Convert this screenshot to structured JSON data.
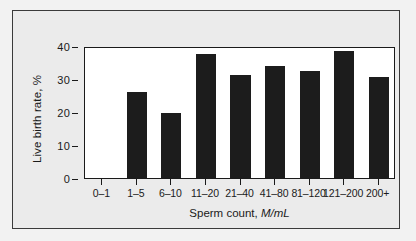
{
  "chart_data": {
    "type": "bar",
    "title": "",
    "xlabel_prefix": "Sperm count, ",
    "xlabel_unit": "M/mL",
    "ylabel": "Live birth rate, %",
    "categories": [
      "0–1",
      "1–5",
      "6–10",
      "11–20",
      "21–40",
      "41–80",
      "81–120",
      "121–200",
      "200+"
    ],
    "values": [
      0,
      26.1,
      19.6,
      37.6,
      31.2,
      34.0,
      32.4,
      38.6,
      30.7
    ],
    "ylim": [
      0,
      40
    ],
    "yticks": [
      0,
      10,
      20,
      30,
      40
    ],
    "ytick_labels": [
      "0",
      "10",
      "20",
      "30",
      "40"
    ],
    "grid": false,
    "legend": "none",
    "bar_color": "#1c1c1c",
    "plot_background": "#ffffff",
    "panel_background": "#ebebeb",
    "axis_color": "#1a1a1a"
  }
}
